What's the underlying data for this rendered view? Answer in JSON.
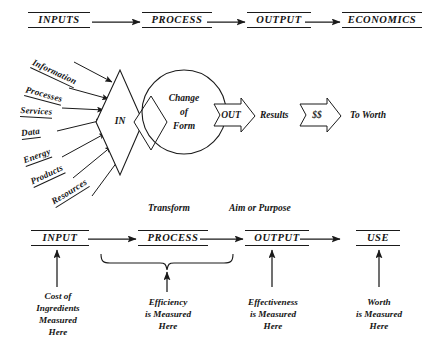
{
  "diagram": {
    "ink_color": "#1a1a1a",
    "background": "#ffffff"
  },
  "top_row": {
    "stages": [
      {
        "label": "INPUTS"
      },
      {
        "label": "PROCESS"
      },
      {
        "label": "OUTPUT"
      },
      {
        "label": "ECONOMICS"
      }
    ]
  },
  "inputs_fan": {
    "labels": [
      {
        "text": "Information"
      },
      {
        "text": "Processes"
      },
      {
        "text": "Services"
      },
      {
        "text": "Data"
      },
      {
        "text": "Energy"
      },
      {
        "text": "Products"
      },
      {
        "text": "Resources"
      }
    ]
  },
  "center": {
    "in_diamond": "IN",
    "circle_line1": "Change",
    "circle_line2": "of",
    "circle_line3": "Form",
    "out_arrow": "OUT",
    "results": "Results",
    "money_arrow": "$$",
    "to_worth": "To Worth"
  },
  "bottom_row": {
    "annotations": [
      {
        "text": "Transform"
      },
      {
        "text": "Aim or Purpose"
      }
    ],
    "stages": [
      {
        "label": "INPUT"
      },
      {
        "label": "PROCESS"
      },
      {
        "label": "OUTPUT"
      },
      {
        "label": "USE"
      }
    ],
    "captions": [
      {
        "line1": "Cost of",
        "line2": "Ingredients",
        "line3": "Measured",
        "line4": "Here"
      },
      {
        "line1": "Efficiency",
        "line2": "is Measured",
        "line3": "Here",
        "line4": ""
      },
      {
        "line1": "Effectiveness",
        "line2": "is Measured",
        "line3": "Here",
        "line4": ""
      },
      {
        "line1": "Worth",
        "line2": "is Measured",
        "line3": "Here",
        "line4": ""
      }
    ]
  }
}
